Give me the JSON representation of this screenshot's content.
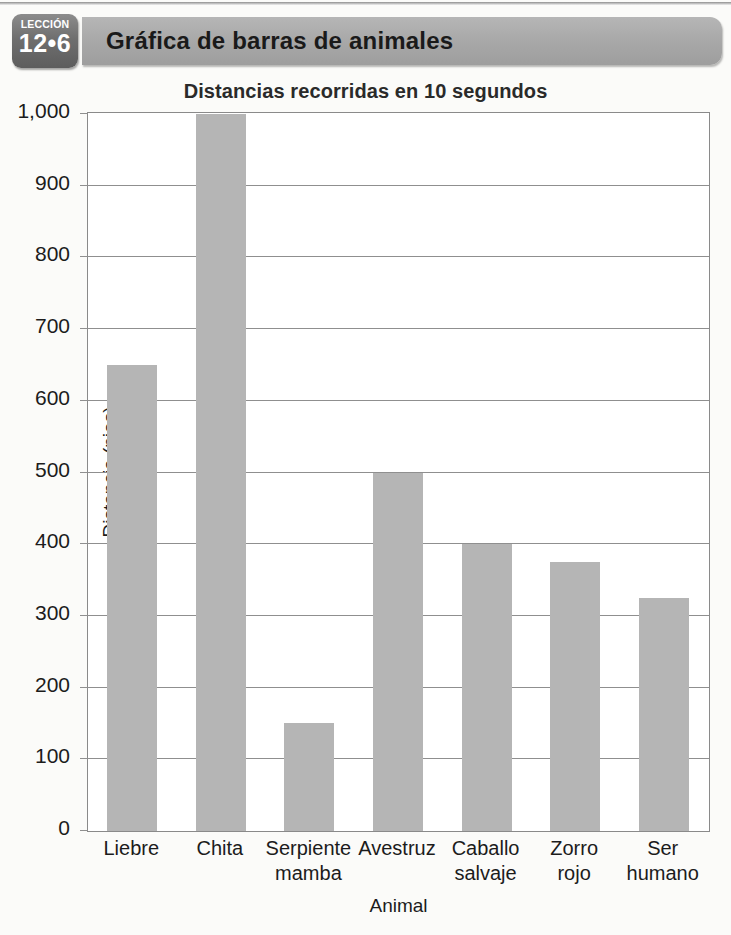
{
  "header": {
    "lesson_label": "LECCIÓN",
    "lesson_number": "12•6",
    "banner_title": "Gráfica de barras de animales",
    "banner_color": "#a8a8a8",
    "badge_color": "#6f6f6f"
  },
  "chart_data": {
    "type": "bar",
    "title": "Distancias recorridas en 10 segundos",
    "xlabel": "Animal",
    "ylabel": "Distancia (pies)",
    "categories": [
      "Liebre",
      "Chita",
      "Serpiente mamba",
      "Avestruz",
      "Caballo salvaje",
      "Zorro rojo",
      "Ser humano"
    ],
    "category_lines": [
      [
        "Liebre"
      ],
      [
        "Chita"
      ],
      [
        "Serpiente",
        "mamba"
      ],
      [
        "Avestruz"
      ],
      [
        "Caballo",
        "salvaje"
      ],
      [
        "Zorro",
        "rojo"
      ],
      [
        "Ser",
        "humano"
      ]
    ],
    "values": [
      650,
      1000,
      150,
      500,
      400,
      375,
      325
    ],
    "ylim": [
      0,
      1000
    ],
    "yticks": [
      0,
      100,
      200,
      300,
      400,
      500,
      600,
      700,
      800,
      900,
      1000
    ],
    "ytick_labels": [
      "0",
      "100",
      "200",
      "300",
      "400",
      "500",
      "600",
      "700",
      "800",
      "900",
      "1,000"
    ],
    "grid": true,
    "legend": false,
    "bar_color": "#b5b5b5",
    "axis_color": "#8a8a8a"
  }
}
